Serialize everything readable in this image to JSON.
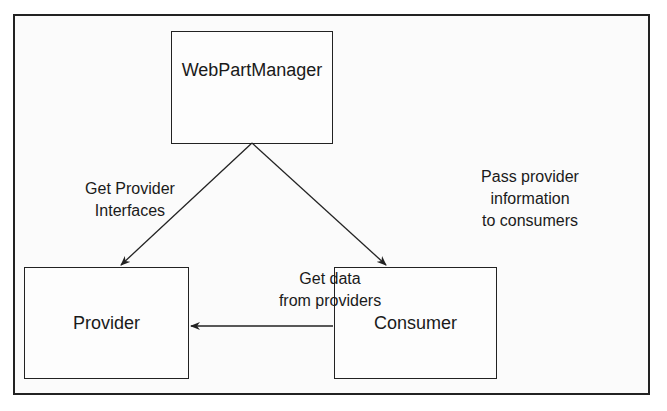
{
  "diagram": {
    "nodes": {
      "manager": {
        "label": "WebPartManager"
      },
      "provider": {
        "label": "Provider"
      },
      "consumer": {
        "label": "Consumer"
      }
    },
    "edges": {
      "get_interfaces": {
        "from": "manager",
        "to": "provider",
        "line1": "Get Provider",
        "line2": "Interfaces"
      },
      "pass_info": {
        "from": "manager",
        "to": "consumer",
        "line1": "Pass provider",
        "line2": "information",
        "line3": "to consumers"
      },
      "get_data": {
        "from": "consumer",
        "to": "provider",
        "line1": "Get data",
        "line2": "from providers"
      }
    }
  }
}
